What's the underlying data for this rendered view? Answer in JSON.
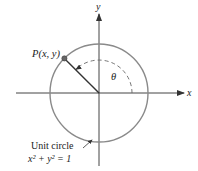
{
  "diagram": {
    "title": "Unit circle",
    "point_label": "P(x, y)",
    "angle_label": "θ",
    "x_axis_label": "x",
    "y_axis_label": "y",
    "caption_line1": "Unit circle",
    "caption_line2": "x² + y² = 1",
    "colors": {
      "circle": "#8a8a8a",
      "axes": "#333333",
      "point": "#666666",
      "text": "#222222"
    }
  }
}
